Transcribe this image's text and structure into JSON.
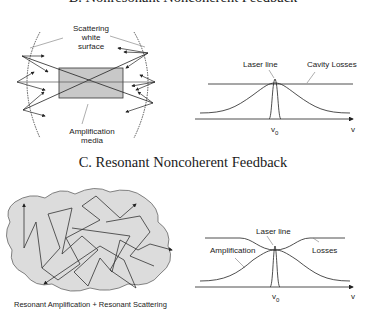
{
  "section_b": {
    "title": "B. Nonresonant Noncoherent Feedback",
    "diagram": {
      "label_scattering_line1": "Scattering",
      "label_scattering_line2": "white",
      "label_scattering_line3": "surface",
      "label_amplification_line1": "Amplification",
      "label_amplification_line2": "media"
    },
    "spectrum": {
      "label_laser_line": "Laser line",
      "label_cavity_losses": "Cavity Losses",
      "x_tick": "v",
      "x_tick_sub": "0",
      "x_axis_label": "v"
    }
  },
  "section_c": {
    "title": "C. Resonant Noncoherent Feedback",
    "diagram": {
      "caption": "Resonant Amplification + Resonant Scattering"
    },
    "spectrum": {
      "label_laser_line": "Laser line",
      "label_amplification": "Amplification",
      "label_losses": "Losses",
      "x_tick": "v",
      "x_tick_sub": "0",
      "x_axis_label": "v"
    }
  },
  "colors": {
    "box_fill": "#c8c8c8",
    "cloud_fill": "#dcdcdc",
    "line": "#222222"
  }
}
